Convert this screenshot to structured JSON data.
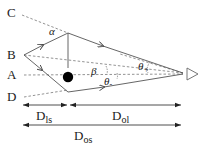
{
  "diagram": {
    "points": {
      "C": "C",
      "B": "B",
      "A": "A",
      "D": "D"
    },
    "angles": {
      "alpha": "α",
      "beta": "β",
      "theta_plus": "θ",
      "theta_plus_sub": "+",
      "theta_minus": "θ",
      "theta_minus_sub": "-"
    },
    "distances": {
      "dls_main": "D",
      "dls_sub": "ls",
      "dol_main": "D",
      "dol_sub": "ol",
      "dos_main": "D",
      "dos_sub": "os"
    },
    "elements": {
      "lens": "lens-mass",
      "observer": "observer"
    },
    "colors": {
      "line": "#555555",
      "dashed": "#777777",
      "lens": "#000000"
    }
  }
}
